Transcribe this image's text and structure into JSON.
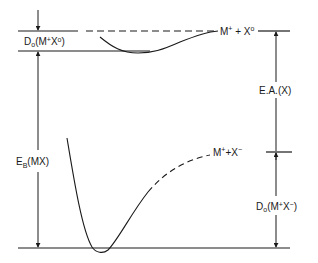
{
  "diagram": {
    "colors": {
      "line": "#1a1a1a",
      "background": "#ffffff"
    },
    "labels": {
      "d0_neutral": {
        "main": "D",
        "sub": "o",
        "paren": "(M",
        "sup1": "+",
        "mid": "X",
        "sup2": "o",
        "close": ")"
      },
      "eb": {
        "main": "E",
        "sub": "B",
        "rest": "(MX)"
      },
      "neutral_asymptote": {
        "m": "M",
        "sup1": "+",
        "plus": " + ",
        "x": "X",
        "sup2": "o"
      },
      "ionic_asymptote": {
        "m": "M",
        "sup1": "+",
        "plus": "+",
        "x": "X",
        "sup2": "−"
      },
      "electron_affinity": "E.A.(X)",
      "d0_ionic": {
        "main": "D",
        "sub": "o",
        "paren": "(M",
        "sup1": "+",
        "mid": "X",
        "sup2": "−",
        "close": ")"
      }
    },
    "levels": [
      {
        "name": "neutral-asymptote",
        "y": 31
      },
      {
        "name": "covalent-minimum",
        "y": 51
      },
      {
        "name": "ionic-asymptote",
        "y": 152
      },
      {
        "name": "ionic-minimum",
        "y": 248
      }
    ],
    "curves": [
      {
        "name": "covalent-potential-curve",
        "style": "solid"
      },
      {
        "name": "ionic-potential-curve",
        "style": "solid-then-dashed"
      }
    ]
  }
}
